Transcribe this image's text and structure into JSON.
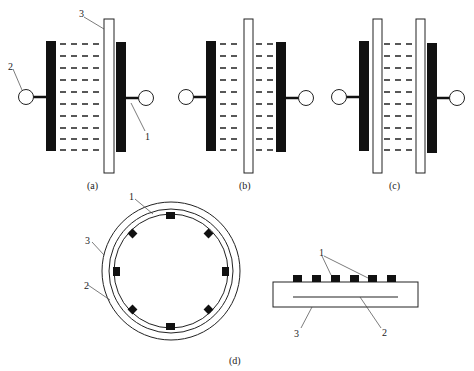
{
  "figure": {
    "panels": [
      {
        "id": "a",
        "caption": "(a)",
        "callouts": {
          "electrode": "1",
          "terminal": "2",
          "membrane": "3"
        }
      },
      {
        "id": "b",
        "caption": "(b)"
      },
      {
        "id": "c",
        "caption": "(c)"
      },
      {
        "id": "d",
        "caption": "(d)",
        "ring_callouts": {
          "electrode": "1",
          "inner_layer": "2",
          "outer_layer": "3"
        },
        "bar_callouts": {
          "electrodes": "1",
          "inner_layer": "2",
          "substrate": "3"
        }
      }
    ],
    "colors": {
      "ink": "#111111",
      "line": "#222222",
      "background": "#ffffff"
    }
  }
}
